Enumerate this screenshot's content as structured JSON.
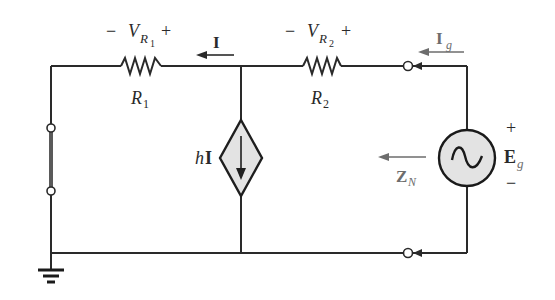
{
  "diagram": {
    "type": "circuit-schematic",
    "colors": {
      "wire": "#2a2a2a",
      "source_fill": "#e3e3e3",
      "short": "#5a5a5a",
      "annotation_gray": "#6d6d6d"
    },
    "components": {
      "r1": {
        "name": "R",
        "sub": "1",
        "voltage_label": {
          "minus": "−",
          "V": "V",
          "R": "R",
          "sub": "1",
          "plus": "+"
        }
      },
      "r2": {
        "name": "R",
        "sub": "2",
        "voltage_label": {
          "minus": "−",
          "V": "V",
          "R": "R",
          "sub": "2",
          "plus": "+"
        }
      },
      "current_I": {
        "label": "I"
      },
      "dependent_source": {
        "coef": "h",
        "var": "I"
      },
      "ac_source": {
        "name": "E",
        "sub": "g",
        "plus": "+",
        "minus": "−"
      },
      "current_Ig": {
        "name": "I",
        "sub": "g"
      },
      "impedance_ZN": {
        "name": "Z",
        "sub": "N"
      }
    }
  }
}
